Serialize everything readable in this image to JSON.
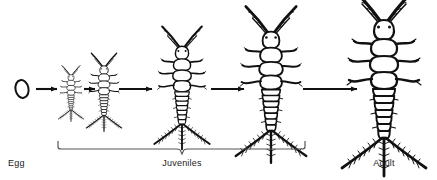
{
  "figure": {
    "background_color": "#ffffff",
    "ink_color": "#111111",
    "bracket_color": "#555555",
    "label_color": "#1a1a1a"
  },
  "labels": {
    "egg": "Egg",
    "juveniles": "Juveniles",
    "adult": "Adult"
  },
  "stages": [
    {
      "id": "egg",
      "name": "Egg",
      "kind": "egg",
      "cx": 22,
      "cy": 89,
      "scale": 0.0
    },
    {
      "id": "instar-1",
      "name": "First instar",
      "kind": "insect",
      "cx": 71,
      "cy": 89,
      "scale": 0.3
    },
    {
      "id": "instar-2",
      "name": "Second instar",
      "kind": "insect",
      "cx": 104,
      "cy": 86,
      "scale": 0.42
    },
    {
      "id": "instar-3",
      "name": "Third instar",
      "kind": "insect",
      "cx": 182,
      "cy": 78,
      "scale": 0.66
    },
    {
      "id": "instar-4",
      "name": "Fourth instar",
      "kind": "insect",
      "cx": 271,
      "cy": 72,
      "scale": 0.84
    },
    {
      "id": "adult",
      "name": "Adult",
      "kind": "insect",
      "cx": 384,
      "cy": 68,
      "scale": 1.0
    }
  ],
  "arrows": [
    {
      "id": "arrow-egg-to-1",
      "x1": 36,
      "x2": 57,
      "y": 89
    },
    {
      "id": "arrow-1-to-2",
      "x1": 84,
      "x2": 95,
      "y": 89
    },
    {
      "id": "arrow-2-to-3",
      "x1": 119,
      "x2": 152,
      "y": 89
    },
    {
      "id": "arrow-3-to-4",
      "x1": 211,
      "x2": 244,
      "y": 89
    },
    {
      "id": "arrow-4-to-adult",
      "x1": 303,
      "x2": 357,
      "y": 89
    }
  ],
  "bracket": {
    "id": "juveniles-bracket",
    "x_left": 58,
    "x_right": 305,
    "y": 148,
    "tip_y": 141,
    "notch_x": 182,
    "notch_y": 154
  }
}
